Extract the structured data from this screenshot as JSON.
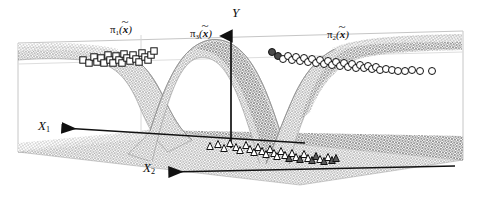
{
  "figure": {
    "type": "3d-surface-plot",
    "background": "#ffffff",
    "width": 481,
    "height": 198,
    "frame_color": "#c8c8c8",
    "axis_color": "#111111",
    "mesh_color": "#7d7d7d"
  },
  "axes": {
    "y": {
      "name": "Y",
      "label": "Y",
      "arrow": "up"
    },
    "x1": {
      "name": "X1",
      "label": "X",
      "sub": "1",
      "arrow": "left"
    },
    "x2": {
      "name": "X2",
      "label": "X",
      "sub": "2",
      "arrow": "left-down"
    }
  },
  "surface_labels": [
    {
      "name": "pi1",
      "pi": "π",
      "sub": "1",
      "open": "(",
      "var": "x",
      "close": ")"
    },
    {
      "name": "pi3",
      "pi": "π",
      "sub": "3",
      "open": "(",
      "var": "x",
      "close": ")"
    },
    {
      "name": "pi2",
      "pi": "π",
      "sub": "2",
      "open": "(",
      "var": "x",
      "close": ")"
    }
  ],
  "chart_data": {
    "type": "scatter",
    "title": "",
    "xlabel": "X1",
    "ylabel": "Y",
    "zlabel": "X2",
    "grid": false,
    "legend": "none",
    "surfaces": [
      {
        "name": "pi1",
        "label": "π1(x̃)",
        "description": "posterior probability surface for class 1, high at left, sigmoid decay to the right"
      },
      {
        "name": "pi3",
        "label": "π3(x̃)",
        "description": "posterior probability surface for class 3, bell/ridge shaped peaking near the centre"
      },
      {
        "name": "pi2",
        "label": "π2(x̃)",
        "description": "posterior probability surface for class 2, low at left, sigmoid rise to the right"
      }
    ],
    "series": [
      {
        "name": "class-1",
        "marker": "square",
        "fill": "#ffffff",
        "edge": "#111111",
        "count": 23,
        "points": [
          [
            83,
            60
          ],
          [
            89,
            63
          ],
          [
            94,
            57
          ],
          [
            97,
            62
          ],
          [
            101,
            58
          ],
          [
            104,
            63
          ],
          [
            108,
            55
          ],
          [
            110,
            60
          ],
          [
            113,
            63
          ],
          [
            116,
            56
          ],
          [
            119,
            60
          ],
          [
            122,
            63
          ],
          [
            124,
            54
          ],
          [
            127,
            58
          ],
          [
            130,
            61
          ],
          [
            133,
            55
          ],
          [
            136,
            59
          ],
          [
            139,
            62
          ],
          [
            142,
            53
          ],
          [
            145,
            57
          ],
          [
            148,
            60
          ],
          [
            151,
            55
          ],
          [
            154,
            51
          ]
        ]
      },
      {
        "name": "class-2",
        "marker": "circle",
        "fill": "#ffffff",
        "edge": "#111111",
        "highlight_fill": "#4a4a4a",
        "count": 34,
        "points": [
          [
            272,
            52
          ],
          [
            278,
            56
          ],
          [
            283,
            59
          ],
          [
            288,
            56
          ],
          [
            292,
            60
          ],
          [
            296,
            57
          ],
          [
            300,
            61
          ],
          [
            304,
            58
          ],
          [
            308,
            62
          ],
          [
            312,
            59
          ],
          [
            316,
            63
          ],
          [
            320,
            60
          ],
          [
            324,
            64
          ],
          [
            328,
            61
          ],
          [
            332,
            65
          ],
          [
            336,
            62
          ],
          [
            340,
            66
          ],
          [
            344,
            63
          ],
          [
            348,
            67
          ],
          [
            352,
            64
          ],
          [
            356,
            68
          ],
          [
            360,
            65
          ],
          [
            364,
            68
          ],
          [
            368,
            66
          ],
          [
            372,
            69
          ],
          [
            376,
            67
          ],
          [
            380,
            70
          ],
          [
            386,
            69
          ],
          [
            392,
            70
          ],
          [
            398,
            71
          ],
          [
            405,
            71
          ],
          [
            412,
            70
          ],
          [
            420,
            71
          ],
          [
            432,
            71
          ]
        ],
        "highlight_points": [
          [
            272,
            52
          ],
          [
            278,
            56
          ]
        ]
      },
      {
        "name": "class-3",
        "marker": "triangle",
        "fill": "#ffffff",
        "edge": "#111111",
        "dark_fill": "#5a5a5a",
        "count": 30,
        "points": [
          [
            210,
            146
          ],
          [
            218,
            144
          ],
          [
            224,
            148
          ],
          [
            230,
            143
          ],
          [
            236,
            147
          ],
          [
            240,
            150
          ],
          [
            246,
            145
          ],
          [
            250,
            149
          ],
          [
            254,
            152
          ],
          [
            258,
            147
          ],
          [
            262,
            151
          ],
          [
            266,
            154
          ],
          [
            270,
            149
          ],
          [
            274,
            153
          ],
          [
            277,
            156
          ],
          [
            281,
            151
          ],
          [
            285,
            155
          ],
          [
            289,
            158
          ],
          [
            292,
            153
          ],
          [
            296,
            157
          ],
          [
            300,
            159
          ],
          [
            304,
            154
          ],
          [
            308,
            158
          ],
          [
            312,
            160
          ],
          [
            316,
            156
          ],
          [
            320,
            159
          ],
          [
            324,
            161
          ],
          [
            328,
            157
          ],
          [
            332,
            160
          ],
          [
            336,
            158
          ]
        ],
        "dark_points": [
          [
            289,
            158
          ],
          [
            300,
            159
          ],
          [
            312,
            160
          ],
          [
            324,
            161
          ],
          [
            332,
            160
          ],
          [
            336,
            158
          ],
          [
            316,
            156
          ]
        ]
      }
    ]
  }
}
